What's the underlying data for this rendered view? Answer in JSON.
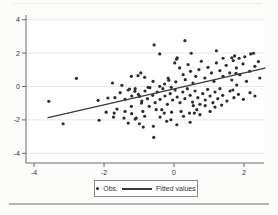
{
  "figure": {
    "legend": {
      "obs_label": "Obs.",
      "fitted_label": "Fitted values"
    }
  },
  "style": {
    "point_color": "#2d2d2d",
    "fit_line_color": "#3a3a3a",
    "grid_color": "#e7e7e5",
    "axis_color": "#6b6b6b",
    "tick_text_color": "#333333",
    "legend_border_color": "#8a8a8a",
    "plot_bg": "#ffffff",
    "page_bg": "#fcfcfa",
    "top_rule_color": "#ebebe9",
    "bottom_rule_color": "#b4b4b2"
  },
  "chart_data": {
    "type": "scatter",
    "title": "",
    "xlabel": "",
    "ylabel": "",
    "xlim": [
      -4.23,
      2.57
    ],
    "ylim": [
      -4.58,
      4.28
    ],
    "x_ticks": [
      -4,
      -2,
      0,
      2
    ],
    "y_ticks": [
      -4,
      -2,
      0,
      2,
      4
    ],
    "grid": "horizontal",
    "legend_position": "bottom-center",
    "series": [
      {
        "name": "Obs.",
        "type": "scatter",
        "marker": "dot",
        "points": [
          [
            -3.58,
            -0.89
          ],
          [
            -3.17,
            -2.23
          ],
          [
            -2.79,
            0.49
          ],
          [
            -2.17,
            -0.83
          ],
          [
            -2.14,
            -2.02
          ],
          [
            -1.94,
            -1.54
          ],
          [
            -1.89,
            -0.69
          ],
          [
            -1.73,
            -1.83
          ],
          [
            -1.76,
            0.21
          ],
          [
            -1.71,
            -1.59
          ],
          [
            -1.63,
            -1.35
          ],
          [
            -0.57,
            2.49
          ],
          [
            -0.41,
            1.95
          ],
          [
            0.31,
            2.74
          ],
          [
            0.07,
            1.63
          ],
          [
            0.49,
            1.99
          ],
          [
            1.21,
            2.14
          ],
          [
            1.4,
            1.69
          ],
          [
            1.73,
            1.83
          ],
          [
            1.86,
            1.69
          ],
          [
            2.02,
            1.78
          ],
          [
            2.19,
            1.95
          ],
          [
            2.27,
            1.99
          ],
          [
            0.09,
            1.71
          ],
          [
            1.69,
            1.55
          ],
          [
            -1.03,
            0.65
          ],
          [
            -0.95,
            0.81
          ],
          [
            -0.84,
            0.55
          ],
          [
            -1.22,
            0.61
          ],
          [
            -0.17,
            0.51
          ],
          [
            0.02,
            1.41
          ],
          [
            0.16,
            1.11
          ],
          [
            0.26,
            0.71
          ],
          [
            0.4,
            1.31
          ],
          [
            0.47,
            0.91
          ],
          [
            0.62,
            0.61
          ],
          [
            0.71,
            1.01
          ],
          [
            0.78,
            1.51
          ],
          [
            0.88,
            0.51
          ],
          [
            0.97,
            1.15
          ],
          [
            1.07,
            0.81
          ],
          [
            1.21,
            1.41
          ],
          [
            1.31,
            0.95
          ],
          [
            1.4,
            0.61
          ],
          [
            1.49,
            1.27
          ],
          [
            1.59,
            0.81
          ],
          [
            1.78,
            1.11
          ],
          [
            1.88,
            0.71
          ],
          [
            1.97,
            1.35
          ],
          [
            2.16,
            0.91
          ],
          [
            2.31,
            1.21
          ],
          [
            2.45,
            0.51
          ],
          [
            2.41,
            1.49
          ],
          [
            1.65,
            1.72
          ],
          [
            -1.49,
            0.07
          ],
          [
            -1.27,
            -0.15
          ],
          [
            -0.74,
            -0.05
          ],
          [
            -0.6,
            0.31
          ],
          [
            -0.41,
            0.01
          ],
          [
            -0.27,
            0.15
          ],
          [
            -0.08,
            -0.05
          ],
          [
            0.32,
            0.41
          ],
          [
            0.54,
            0.21
          ],
          [
            1.14,
            0.31
          ],
          [
            2.07,
            0.31
          ],
          [
            1.77,
            0.79
          ],
          [
            1.65,
            0.39
          ],
          [
            1.79,
            0.09
          ],
          [
            0.05,
            0.28
          ],
          [
            -0.15,
            0.38
          ],
          [
            -1.69,
            -0.67
          ],
          [
            -1.54,
            -0.37
          ],
          [
            -1.4,
            -0.77
          ],
          [
            -1.31,
            -0.21
          ],
          [
            -1.21,
            -0.57
          ],
          [
            -1.11,
            -0.13
          ],
          [
            -1.02,
            -0.47
          ],
          [
            -0.92,
            -0.87
          ],
          [
            -0.83,
            -0.27
          ],
          [
            -0.76,
            -0.73
          ],
          [
            -0.69,
            -0.07
          ],
          [
            -0.61,
            -0.53
          ],
          [
            -0.54,
            -0.97
          ],
          [
            -0.48,
            -0.33
          ],
          [
            -0.4,
            -0.77
          ],
          [
            -0.32,
            -0.13
          ],
          [
            -0.26,
            -0.57
          ],
          [
            -0.19,
            -1.07
          ],
          [
            -0.11,
            -0.43
          ],
          [
            -0.04,
            -0.81
          ],
          [
            0.03,
            -0.21
          ],
          [
            0.09,
            -0.63
          ],
          [
            0.17,
            -0.97
          ],
          [
            0.25,
            -0.33
          ],
          [
            0.31,
            -0.73
          ],
          [
            0.38,
            -0.13
          ],
          [
            0.46,
            -0.53
          ],
          [
            0.53,
            -0.93
          ],
          [
            0.6,
            -0.27
          ],
          [
            0.68,
            -0.67
          ],
          [
            0.74,
            -1.07
          ],
          [
            0.82,
            -0.43
          ],
          [
            0.89,
            -0.81
          ],
          [
            0.96,
            -0.17
          ],
          [
            1.03,
            -0.57
          ],
          [
            1.11,
            -0.97
          ],
          [
            1.17,
            -0.33
          ],
          [
            1.25,
            -0.73
          ],
          [
            1.31,
            -0.13
          ],
          [
            1.39,
            -0.53
          ],
          [
            1.51,
            -0.87
          ],
          [
            1.6,
            -0.27
          ],
          [
            1.71,
            -0.67
          ],
          [
            1.84,
            -0.47
          ],
          [
            1.98,
            -0.77
          ],
          [
            2.17,
            -0.37
          ],
          [
            2.31,
            -0.57
          ],
          [
            1.68,
            -0.21
          ],
          [
            -1.4,
            -1.49
          ],
          [
            -1.43,
            -1.89
          ],
          [
            -1.31,
            -2.19
          ],
          [
            -1.21,
            -1.63
          ],
          [
            -1.11,
            -1.95
          ],
          [
            -0.99,
            -2.23
          ],
          [
            -0.88,
            -2.43
          ],
          [
            -0.59,
            -2.38
          ],
          [
            -0.4,
            -1.83
          ],
          [
            -0.35,
            -1.39
          ],
          [
            -0.21,
            -2.08
          ],
          [
            -0.07,
            -1.54
          ],
          [
            0.08,
            -2.29
          ],
          [
            0.27,
            -1.78
          ],
          [
            0.46,
            -2.14
          ],
          [
            0.44,
            -1.59
          ],
          [
            0.65,
            -1.39
          ],
          [
            0.74,
            -1.69
          ],
          [
            0.89,
            -1.15
          ],
          [
            1.03,
            -1.49
          ],
          [
            1.17,
            -1.23
          ],
          [
            1.36,
            -1.11
          ],
          [
            0.55,
            -1.15
          ],
          [
            -0.71,
            -1.19
          ],
          [
            -0.51,
            -1.39
          ],
          [
            -0.28,
            -1.59
          ],
          [
            -0.09,
            -1.99
          ],
          [
            0.2,
            -1.49
          ],
          [
            0.58,
            -1.59
          ],
          [
            -0.58,
            -3.05
          ],
          [
            -1.12,
            -0.29
          ],
          [
            -0.98,
            -0.59
          ],
          [
            -0.93,
            -0.99
          ],
          [
            -0.89,
            -1.49
          ],
          [
            -0.84,
            -1.78
          ],
          [
            -1.08,
            -1.89
          ],
          [
            -1.22,
            -1.19
          ]
        ]
      },
      {
        "name": "Fitted values",
        "type": "line",
        "points": [
          [
            -3.6,
            -1.87
          ],
          [
            2.6,
            1.1
          ]
        ]
      }
    ]
  }
}
